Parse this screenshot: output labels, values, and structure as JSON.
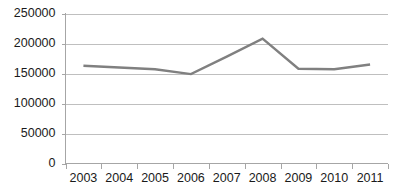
{
  "chart_data": {
    "type": "line",
    "title": "",
    "subtitle": "",
    "xlabel": "",
    "ylabel": "",
    "categories": [
      "2003",
      "2004",
      "2005",
      "2006",
      "2007",
      "2008",
      "2009",
      "2010",
      "2011"
    ],
    "series": [
      {
        "name": "",
        "color": "#808080",
        "values": [
          163000,
          160000,
          157000,
          149000,
          178000,
          208000,
          158000,
          157000,
          165000
        ]
      }
    ],
    "ylim": [
      0,
      250000
    ],
    "ytick_values": [
      0,
      50000,
      100000,
      150000,
      200000,
      250000
    ],
    "ytick_labels": [
      "0",
      "50000",
      "100000",
      "150000",
      "200000",
      "250000"
    ],
    "grid": {
      "horizontal": true,
      "vertical": false,
      "color": "#bfbfbf"
    },
    "legend": {
      "visible": false,
      "position": "none",
      "entries": []
    },
    "axis": {
      "color": "#a6a6a6",
      "y_axis_visible": true,
      "x_axis_visible": true,
      "ticks_visible": true
    },
    "background_color": "#ffffff",
    "annotations": []
  }
}
